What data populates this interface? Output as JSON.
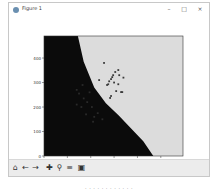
{
  "window": {
    "title": "Figure 1",
    "controls": {
      "minimize": "–",
      "maximize": "□",
      "close": "×"
    }
  },
  "toolbar": {
    "buttons": [
      {
        "name": "home-icon",
        "glyph": "⌂"
      },
      {
        "name": "back-icon",
        "glyph": "←"
      },
      {
        "name": "forward-icon",
        "glyph": "→"
      },
      {
        "name": "pan-icon",
        "glyph": "✚"
      },
      {
        "name": "zoom-icon",
        "glyph": "⚲"
      },
      {
        "name": "configure-subplots-icon",
        "glyph": "≡"
      },
      {
        "name": "save-icon",
        "glyph": "▣"
      }
    ]
  },
  "caption": "· · · · · · · · · · · ·",
  "colors": {
    "region_a": "#0b0b0b",
    "region_b": "#dcdcdc",
    "points_on_light": "#3a3a3a",
    "points_on_dark": "#2a2a2a"
  },
  "chart_data": {
    "type": "scatter",
    "title": "",
    "xlabel": "",
    "ylabel": "",
    "xlim": [
      0,
      595
    ],
    "ylim": [
      0,
      490
    ],
    "xticks": [
      0,
      100,
      200,
      300,
      400,
      500
    ],
    "yticks": [
      0,
      100,
      200,
      300,
      400
    ],
    "grid": false,
    "legend": null,
    "decision_boundary": [
      [
        145,
        490
      ],
      [
        170,
        385
      ],
      [
        215,
        280
      ],
      [
        265,
        215
      ],
      [
        320,
        165
      ],
      [
        375,
        110
      ],
      [
        425,
        60
      ],
      [
        468,
        0
      ]
    ],
    "regions": [
      {
        "name": "class-0-region",
        "side": "left-of-boundary",
        "color": "#0b0b0b"
      },
      {
        "name": "class-1-region",
        "side": "right-of-boundary",
        "color": "#dcdcdc"
      }
    ],
    "series": [
      {
        "name": "class-1-points",
        "points": [
          [
            257,
            380
          ],
          [
            236,
            310
          ],
          [
            292,
            322
          ],
          [
            287,
            314
          ],
          [
            279,
            305
          ],
          [
            275,
            293
          ],
          [
            296,
            330
          ],
          [
            305,
            343
          ],
          [
            318,
            351
          ],
          [
            318,
            293
          ],
          [
            330,
            261
          ],
          [
            335,
            261
          ],
          [
            309,
            265
          ],
          [
            287,
            245
          ],
          [
            283,
            237
          ],
          [
            270,
            290
          ],
          [
            300,
            300
          ],
          [
            322,
            330
          ],
          [
            340,
            320
          ]
        ]
      },
      {
        "name": "class-0-points",
        "points": [
          [
            140,
            270
          ],
          [
            150,
            255
          ],
          [
            165,
            290
          ],
          [
            170,
            235
          ],
          [
            185,
            220
          ],
          [
            195,
            260
          ],
          [
            160,
            200
          ],
          [
            180,
            170
          ],
          [
            205,
            200
          ],
          [
            215,
            160
          ],
          [
            230,
            175
          ],
          [
            210,
            140
          ],
          [
            140,
            210
          ],
          [
            250,
            150
          ]
        ]
      }
    ]
  }
}
